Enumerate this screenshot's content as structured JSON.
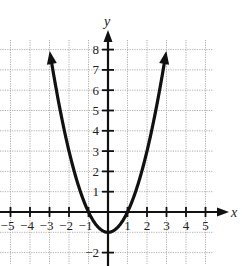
{
  "chart_data": {
    "type": "line",
    "title": "",
    "xlabel": "x",
    "ylabel": "y",
    "xlim": [
      -5.5,
      5.8
    ],
    "ylim": [
      -2.4,
      8.8
    ],
    "grid": true,
    "grid_style": "dotted",
    "x_ticks": [
      -5,
      -4,
      -3,
      -2,
      -1,
      1,
      2,
      3,
      4,
      5
    ],
    "x_tick_labels": [
      "−5",
      "−4",
      "−3",
      "−2",
      "−1",
      "1",
      "2",
      "3",
      "4",
      "5"
    ],
    "y_ticks": [
      -2,
      1,
      2,
      3,
      4,
      5,
      6,
      7,
      8
    ],
    "y_tick_labels": [
      "−2",
      "1",
      "2",
      "3",
      "4",
      "5",
      "6",
      "7",
      "8"
    ],
    "series": [
      {
        "name": "y = x^2 - 1",
        "equation": "x^2 - 1",
        "x": [
          -3,
          -2,
          -1,
          0,
          1,
          2,
          3
        ],
        "values": [
          8,
          3,
          0,
          -1,
          0,
          3,
          8
        ],
        "arrows_at_ends": true,
        "color": "#111111"
      }
    ],
    "vertex": [
      0,
      -1
    ],
    "x_intercepts": [
      -1,
      1
    ]
  },
  "colors": {
    "curve": "#111111",
    "axis": "#111111",
    "grid": "#9a9a9a",
    "background": "#ffffff"
  }
}
